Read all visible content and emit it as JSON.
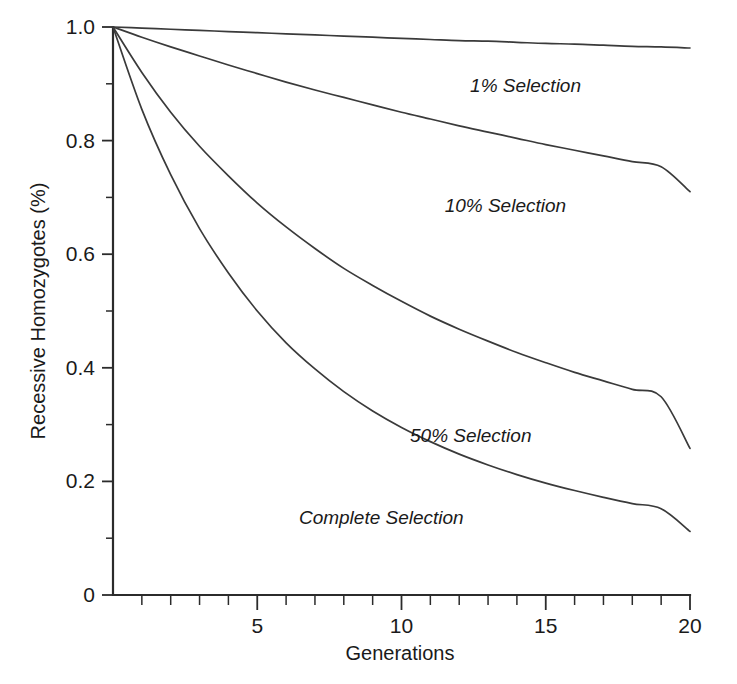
{
  "chart_data": {
    "type": "line",
    "title": "",
    "xlabel": "Generations",
    "ylabel": "Recessive Homozygotes (%)",
    "xlim": [
      0,
      20
    ],
    "ylim": [
      0,
      1.0
    ],
    "grid": false,
    "legend_position": "inline-annotations",
    "x_ticks_major": [
      5,
      10,
      15,
      20
    ],
    "x_tick_labels": [
      "5",
      "10",
      "15",
      "20"
    ],
    "x_minor_tick_step": 1,
    "y_ticks_major": [
      0,
      0.2,
      0.4,
      0.6,
      0.8,
      1.0
    ],
    "y_tick_labels": [
      "0",
      "0.2",
      "0.4",
      "0.6",
      "0.8",
      "1.0"
    ],
    "y_minor_tick_step": 0.1,
    "x": [
      0,
      1,
      2,
      3,
      4,
      5,
      6,
      7,
      8,
      9,
      10,
      11,
      12,
      13,
      14,
      15,
      16,
      17,
      18,
      19,
      20
    ],
    "series": [
      {
        "name": "1% Selection",
        "label": "1% Selection",
        "color": "#3a3a3a",
        "values": [
          1.0,
          0.998,
          0.996,
          0.994,
          0.992,
          0.99,
          0.988,
          0.986,
          0.984,
          0.982,
          0.98,
          0.978,
          0.976,
          0.975,
          0.973,
          0.971,
          0.97,
          0.968,
          0.966,
          0.965,
          0.963
        ]
      },
      {
        "name": "10% Selection",
        "label": "10% Selection",
        "color": "#3a3a3a",
        "values": [
          1.0,
          0.982,
          0.965,
          0.949,
          0.933,
          0.918,
          0.903,
          0.889,
          0.876,
          0.863,
          0.85,
          0.838,
          0.826,
          0.815,
          0.804,
          0.793,
          0.783,
          0.773,
          0.763,
          0.754,
          0.71
        ]
      },
      {
        "name": "50% Selection",
        "label": "50% Selection",
        "color": "#3a3a3a",
        "values": [
          1.0,
          0.92,
          0.85,
          0.79,
          0.738,
          0.69,
          0.648,
          0.61,
          0.575,
          0.545,
          0.517,
          0.491,
          0.468,
          0.447,
          0.427,
          0.409,
          0.392,
          0.377,
          0.362,
          0.349,
          0.258
        ]
      },
      {
        "name": "Complete Selection",
        "label": "Complete Selection",
        "color": "#3a3a3a",
        "values": [
          1.0,
          0.855,
          0.74,
          0.645,
          0.567,
          0.5,
          0.444,
          0.398,
          0.358,
          0.324,
          0.295,
          0.27,
          0.248,
          0.229,
          0.212,
          0.197,
          0.184,
          0.172,
          0.161,
          0.152,
          0.112
        ]
      }
    ],
    "annotations": [
      {
        "text": "1% Selection",
        "x": 14.3,
        "y": 0.885
      },
      {
        "text": "10% Selection",
        "x": 13.6,
        "y": 0.675
      },
      {
        "text": "50% Selection",
        "x": 12.4,
        "y": 0.27
      },
      {
        "text": "Complete Selection",
        "x": 9.3,
        "y": 0.125
      }
    ]
  },
  "style": {
    "background": "#ffffff",
    "axis_color": "#2b2b2b",
    "curve_color": "#3a3a3a",
    "text_color": "#1a1a1a"
  }
}
